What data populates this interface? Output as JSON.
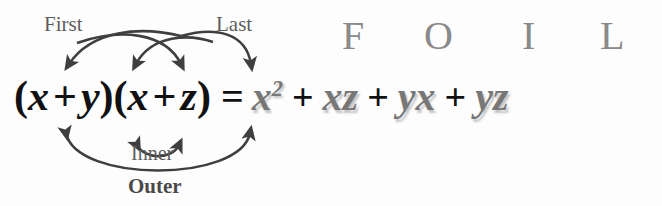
{
  "diagram": {
    "background_color": "#fdfdfd"
  },
  "equation": {
    "left_side": {
      "open_paren_1": "(",
      "term_a": "x",
      "operator_1": "+",
      "term_b": "y",
      "close_paren_1": ")",
      "open_paren_2": "(",
      "term_c": "x",
      "operator_2": "+",
      "term_d": "z",
      "close_paren_2": ")",
      "full_text": "(x + y)(x + z)",
      "color": "#111111"
    },
    "equals": "=",
    "right_side": {
      "color": "#777777",
      "full_text": "x2 + xz + yx + yz",
      "terms": [
        {
          "base": "x",
          "exponent": "2",
          "operator_before": ""
        },
        {
          "base": "xz",
          "exponent": "",
          "operator_before": "+"
        },
        {
          "base": "yx",
          "exponent": "",
          "operator_before": "+"
        },
        {
          "base": "yz",
          "exponent": "",
          "operator_before": "+"
        }
      ]
    }
  },
  "foil": {
    "letters": [
      {
        "letter": "F",
        "meaning": "First",
        "product": "x2"
      },
      {
        "letter": "O",
        "meaning": "Outer",
        "product": "xz"
      },
      {
        "letter": "I",
        "meaning": "Inner",
        "product": "yx"
      },
      {
        "letter": "L",
        "meaning": "Last",
        "product": "yz"
      }
    ],
    "color": "#8a8a8a"
  },
  "labels": {
    "first": "First",
    "last": "Last",
    "inner": "Inner",
    "outer": "Outer",
    "color": "#5e5e5e"
  },
  "arrows": {
    "stroke_color": "#3f3f3f",
    "items": [
      {
        "name": "first-arc",
        "label": "First",
        "from": "x (first)",
        "to": "x (second)",
        "position": "above"
      },
      {
        "name": "last-arc",
        "label": "Last",
        "from": "y",
        "to": "z",
        "position": "above"
      },
      {
        "name": "inner-arc",
        "label": "Inner",
        "from": "y",
        "to": "x (second)",
        "position": "below"
      },
      {
        "name": "outer-arc",
        "label": "Outer",
        "from": "x (first)",
        "to": "z",
        "position": "below"
      }
    ]
  }
}
